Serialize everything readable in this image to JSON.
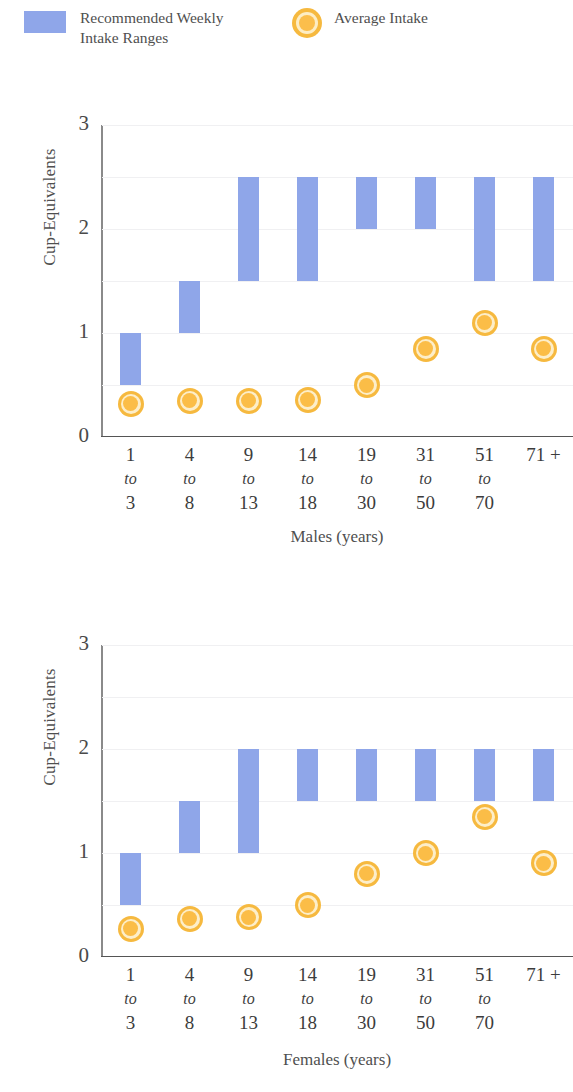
{
  "legend": {
    "items": [
      {
        "name": "recommended-range",
        "label": "Recommended Weekly\nIntake Ranges",
        "icon": "bar-swatch",
        "color": "#8fa6e9"
      },
      {
        "name": "average-intake",
        "label": "Average Intake",
        "icon": "circle-marker",
        "color": "#f6b93f"
      }
    ]
  },
  "chart_data": [
    {
      "type": "bar",
      "name": "males",
      "title": "",
      "xlabel": "Males (years)",
      "ylabel": "Cup-Equivalents",
      "ylim": [
        0,
        3
      ],
      "yticks": [
        0,
        1,
        2,
        3
      ],
      "ytick_labels": [
        "0",
        "1",
        "2",
        "3"
      ],
      "gridlines": [
        0.5,
        1,
        1.5,
        2,
        2.5,
        3
      ],
      "grid": true,
      "legend_position": "top",
      "categories": [
        "1 to 3",
        "4 to 8",
        "9 to 13",
        "14 to 18",
        "19 to 30",
        "31 to 50",
        "51 to 70",
        "71 +"
      ],
      "category_lines": [
        {
          "v1": "1",
          "to": "to",
          "v2": "3"
        },
        {
          "v1": "4",
          "to": "to",
          "v2": "8"
        },
        {
          "v1": "9",
          "to": "to",
          "v2": "13"
        },
        {
          "v1": "14",
          "to": "to",
          "v2": "18"
        },
        {
          "v1": "19",
          "to": "to",
          "v2": "30"
        },
        {
          "v1": "31",
          "to": "to",
          "v2": "50"
        },
        {
          "v1": "51",
          "to": "to",
          "v2": "70"
        },
        {
          "v1": "71 +",
          "to": "",
          "v2": ""
        }
      ],
      "series": [
        {
          "name": "Recommended Weekly Intake Ranges",
          "type": "range-bar",
          "low": [
            0.5,
            1.0,
            1.5,
            1.5,
            2.0,
            2.0,
            1.5,
            1.5
          ],
          "high": [
            1.0,
            1.5,
            2.5,
            2.5,
            2.5,
            2.5,
            2.5,
            2.5
          ]
        },
        {
          "name": "Average Intake",
          "type": "marker",
          "values": [
            0.32,
            0.35,
            0.35,
            0.36,
            0.5,
            0.85,
            1.1,
            0.85
          ]
        }
      ]
    },
    {
      "type": "bar",
      "name": "females",
      "title": "",
      "xlabel": "Females (years)",
      "ylabel": "Cup-Equivalents",
      "ylim": [
        0,
        3
      ],
      "yticks": [
        0,
        1,
        2,
        3
      ],
      "ytick_labels": [
        "0",
        "1",
        "2",
        "3"
      ],
      "gridlines": [
        0.5,
        1,
        1.5,
        2,
        2.5,
        3
      ],
      "grid": true,
      "legend_position": "top",
      "categories": [
        "1 to 3",
        "4 to 8",
        "9 to 13",
        "14 to 18",
        "19 to 30",
        "31 to 50",
        "51 to 70",
        "71 +"
      ],
      "category_lines": [
        {
          "v1": "1",
          "to": "to",
          "v2": "3"
        },
        {
          "v1": "4",
          "to": "to",
          "v2": "8"
        },
        {
          "v1": "9",
          "to": "to",
          "v2": "13"
        },
        {
          "v1": "14",
          "to": "to",
          "v2": "18"
        },
        {
          "v1": "19",
          "to": "to",
          "v2": "30"
        },
        {
          "v1": "31",
          "to": "to",
          "v2": "50"
        },
        {
          "v1": "51",
          "to": "to",
          "v2": "70"
        },
        {
          "v1": "71 +",
          "to": "",
          "v2": ""
        }
      ],
      "series": [
        {
          "name": "Recommended Weekly Intake Ranges",
          "type": "range-bar",
          "low": [
            0.5,
            1.0,
            1.0,
            1.5,
            1.5,
            1.5,
            1.5,
            1.5
          ],
          "high": [
            1.0,
            1.5,
            2.0,
            2.0,
            2.0,
            2.0,
            2.0,
            2.0
          ]
        },
        {
          "name": "Average Intake",
          "type": "marker",
          "values": [
            0.27,
            0.37,
            0.38,
            0.5,
            0.8,
            1.0,
            1.35,
            0.9
          ]
        }
      ]
    }
  ]
}
